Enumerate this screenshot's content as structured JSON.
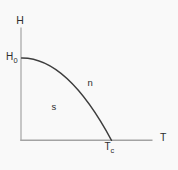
{
  "diagram": {
    "background_color": "#f9f9f9",
    "text_color": "#2e2e2e",
    "axes": {
      "color": "#a3a3a3",
      "y_label": "H",
      "x_label": "T"
    },
    "curve": {
      "color": "#3d3d3d"
    },
    "labels": {
      "h0_main": "H",
      "h0_sub": "0",
      "tc_main": "T",
      "tc_sub": "c",
      "normal_region": "n",
      "superconducting_region": "s"
    }
  }
}
